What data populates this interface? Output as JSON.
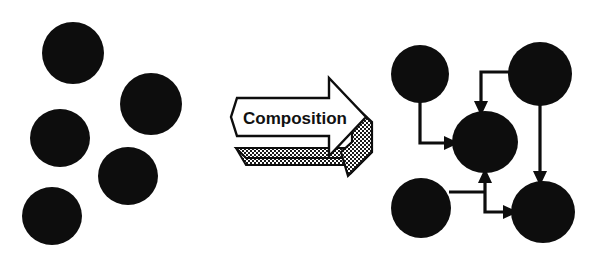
{
  "figure": {
    "title": "Composition",
    "background_color": "#ffffff",
    "node_color": "#0d0d0d",
    "edge_color": "#0d0d0d",
    "label_color": "#111111"
  },
  "left_panel": {
    "name": "unconnected-components",
    "description": "Five unconnected filled circles",
    "nodes": [
      {
        "id": "L1",
        "cx": 73,
        "cy": 53,
        "rx": 31,
        "ry": 31
      },
      {
        "id": "L2",
        "cx": 151,
        "cy": 104,
        "rx": 31,
        "ry": 31
      },
      {
        "id": "L3",
        "cx": 60,
        "cy": 138,
        "rx": 30,
        "ry": 29
      },
      {
        "id": "L4",
        "cx": 128,
        "cy": 176,
        "rx": 30,
        "ry": 29
      },
      {
        "id": "L5",
        "cx": 52,
        "cy": 216,
        "rx": 30,
        "ry": 29
      }
    ]
  },
  "arrow": {
    "name": "composition-arrow",
    "label": "Composition",
    "label_x": 295,
    "label_y": 124,
    "body_fill": "#ffffff",
    "shadow_fill": "#3a3a3a",
    "outline": "#0d0d0d",
    "outline_width": 2.4,
    "direction": "right"
  },
  "right_panel": {
    "name": "composed-system",
    "description": "Five filled circles connected by directed edges",
    "nodes": [
      {
        "id": "A",
        "label": "top-left",
        "cx": 420,
        "cy": 74,
        "rx": 29,
        "ry": 29
      },
      {
        "id": "B",
        "label": "top-right",
        "cx": 540,
        "cy": 74,
        "rx": 32,
        "ry": 32
      },
      {
        "id": "C",
        "label": "center",
        "cx": 485,
        "cy": 142,
        "rx": 33,
        "ry": 31
      },
      {
        "id": "D",
        "label": "bottom-left",
        "cx": 421,
        "cy": 208,
        "rx": 30,
        "ry": 30
      },
      {
        "id": "E",
        "label": "bottom-right",
        "cx": 543,
        "cy": 212,
        "rx": 32,
        "ry": 31
      }
    ],
    "edges": [
      {
        "id": "e1",
        "from": "A",
        "to": "C",
        "route": "down-then-right",
        "arrowhead": "left-side-of-C"
      },
      {
        "id": "e2",
        "from": "B",
        "to": "C",
        "route": "left-then-down",
        "arrowhead": "top-of-C"
      },
      {
        "id": "e3",
        "from": "B",
        "to": "E",
        "route": "straight-down",
        "arrowhead": "top-of-E"
      },
      {
        "id": "e4",
        "from": "D",
        "to": "C",
        "route": "right-then-up",
        "arrowhead": "bottom-of-C"
      },
      {
        "id": "e5",
        "from": "D",
        "to": "E",
        "route": "right-down-right",
        "arrowhead": "left-side-of-E"
      }
    ]
  }
}
